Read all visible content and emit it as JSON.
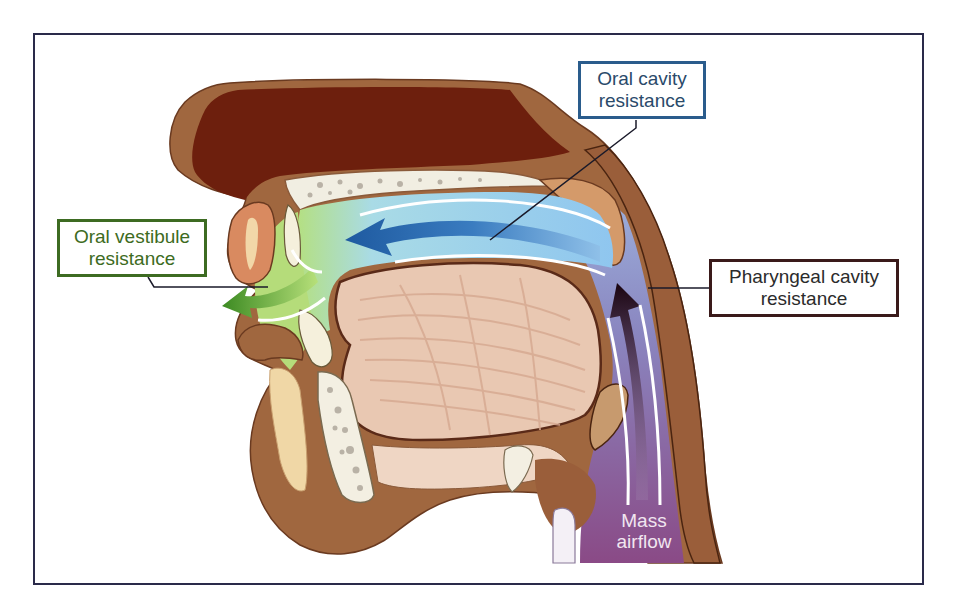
{
  "diagram": {
    "labels": {
      "oral_cavity": {
        "line1": "Oral cavity",
        "line2": "resistance",
        "color": "#2a5c8c"
      },
      "oral_vestibule": {
        "line1": "Oral vestibule",
        "line2": "resistance",
        "color": "#3d6b22"
      },
      "pharyngeal_cavity": {
        "line1": "Pharyngeal cavity",
        "line2": "resistance",
        "color": "#3a1a1a"
      },
      "mass_airflow": {
        "line1": "Mass",
        "line2": "airflow",
        "color": "#f1e6f0"
      }
    },
    "colors": {
      "skin": "#9a6040",
      "nasal_cavity": "#6a1e0c",
      "oral_flow_blue": "#8ec8ee",
      "vestibule_green": "#a7d46a",
      "pharynx_purple": "#8a5a95",
      "tongue": "#e8c6b0",
      "bone": "#f3efe2",
      "frame_border": "#2a2a4a"
    },
    "arrows": [
      {
        "name": "oral-flow-arrow",
        "direction": "left",
        "color": "#2a6cb0"
      },
      {
        "name": "vestibule-flow-arrow",
        "direction": "left",
        "color": "#4c9a2a"
      },
      {
        "name": "pharyngeal-flow-arrow",
        "direction": "up",
        "color": "#2a0a1a"
      }
    ]
  }
}
